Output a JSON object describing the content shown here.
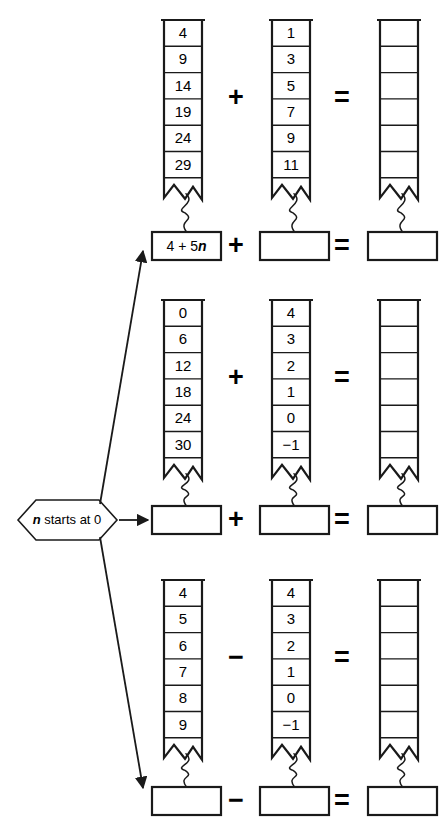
{
  "diagram": {
    "start_node": {
      "label_prefix": "n",
      "label_rest": " starts at 0"
    },
    "operators": {
      "plus": "+",
      "minus": "−",
      "equals": "="
    },
    "groups": [
      {
        "id": "group-1",
        "operator": "+",
        "equals": "=",
        "columns": [
          {
            "id": "col-1a",
            "values": [
              "4",
              "9",
              "14",
              "19",
              "24",
              "29"
            ],
            "formula": ""
          },
          {
            "id": "col-1b",
            "values": [
              "1",
              "3",
              "5",
              "7",
              "9",
              "11"
            ],
            "formula": ""
          },
          {
            "id": "col-1c",
            "values": [
              "",
              "",
              "",
              "",
              "",
              ""
            ],
            "formula": ""
          }
        ],
        "formulas": [
          {
            "id": "formula-1a",
            "prefix": "4 + 5",
            "ital": "n",
            "filled": true
          },
          {
            "id": "formula-1b",
            "prefix": "",
            "ital": "",
            "filled": false
          },
          {
            "id": "formula-1c",
            "prefix": "",
            "ital": "",
            "filled": false
          }
        ]
      },
      {
        "id": "group-2",
        "operator": "+",
        "equals": "=",
        "columns": [
          {
            "id": "col-2a",
            "values": [
              "0",
              "6",
              "12",
              "18",
              "24",
              "30"
            ],
            "formula": ""
          },
          {
            "id": "col-2b",
            "values": [
              "4",
              "3",
              "2",
              "1",
              "0",
              "−1"
            ],
            "formula": ""
          },
          {
            "id": "col-2c",
            "values": [
              "",
              "",
              "",
              "",
              "",
              ""
            ],
            "formula": ""
          }
        ],
        "formulas": [
          {
            "id": "formula-2a",
            "prefix": "",
            "ital": "",
            "filled": false
          },
          {
            "id": "formula-2b",
            "prefix": "",
            "ital": "",
            "filled": false
          },
          {
            "id": "formula-2c",
            "prefix": "",
            "ital": "",
            "filled": false
          }
        ]
      },
      {
        "id": "group-3",
        "operator": "−",
        "equals": "=",
        "columns": [
          {
            "id": "col-3a",
            "values": [
              "4",
              "5",
              "6",
              "7",
              "8",
              "9"
            ],
            "formula": ""
          },
          {
            "id": "col-3b",
            "values": [
              "4",
              "3",
              "2",
              "1",
              "0",
              "−1"
            ],
            "formula": ""
          },
          {
            "id": "col-3c",
            "values": [
              "",
              "",
              "",
              "",
              "",
              ""
            ],
            "formula": ""
          }
        ],
        "formulas": [
          {
            "id": "formula-3a",
            "prefix": "",
            "ital": "",
            "filled": false
          },
          {
            "id": "formula-3b",
            "prefix": "",
            "ital": "",
            "filled": false
          },
          {
            "id": "formula-3c",
            "prefix": "",
            "ital": "",
            "filled": false
          }
        ]
      }
    ],
    "colors": {
      "ink": "#1a1a1a",
      "paper": "#ffffff"
    }
  }
}
